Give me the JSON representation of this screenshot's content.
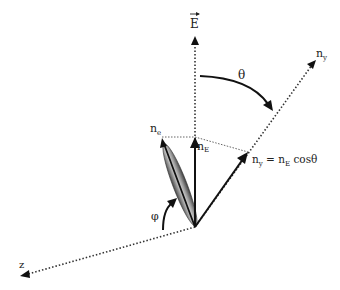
{
  "diagram": {
    "labels": {
      "E_field": "E",
      "n_y_axis": "n",
      "n_y_axis_sub": "y",
      "theta": "θ",
      "n_e": "n",
      "n_e_sub": "e",
      "n_E": "n",
      "n_E_sub": "E",
      "projection_lhs": "n",
      "projection_lhs_sub": "y",
      "projection_eq": " = n",
      "projection_sub": "E",
      "projection_rhs": " cosθ",
      "phi": "φ",
      "z_axis": "z"
    },
    "colors": {
      "line": "#111111",
      "dotted": "#333333",
      "ellipsoid_dark": "#444444",
      "ellipsoid_light": "#cfcfcf"
    }
  }
}
